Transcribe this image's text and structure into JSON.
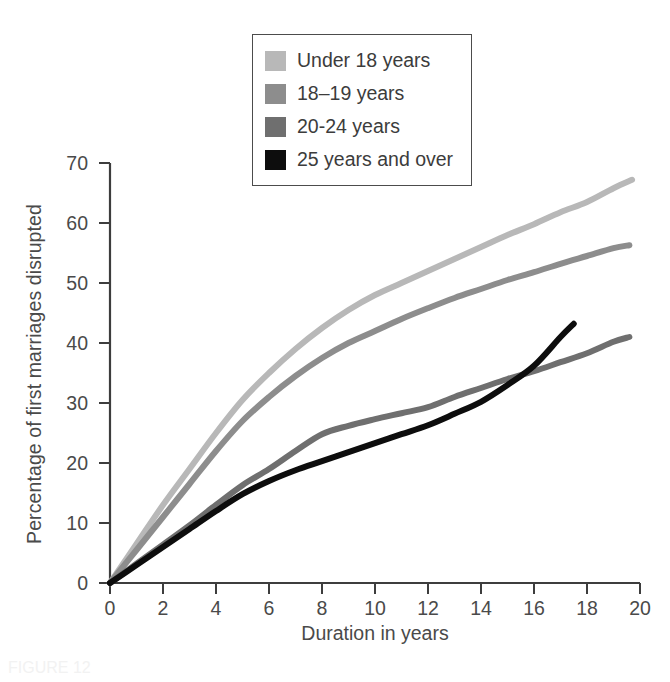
{
  "chart_data": {
    "type": "line",
    "title": "",
    "xlabel": "Duration in years",
    "ylabel": "Percentage of first marriages disrupted",
    "xlim": [
      0,
      20
    ],
    "ylim": [
      0,
      70
    ],
    "xticks": [
      0,
      2,
      4,
      6,
      8,
      10,
      12,
      14,
      16,
      18,
      20
    ],
    "yticks": [
      0,
      10,
      20,
      30,
      40,
      50,
      60,
      70
    ],
    "grid": false,
    "legend_position": "top-center",
    "series": [
      {
        "name": "Under 18 years",
        "color": "#b8b8b8",
        "x": [
          0,
          1,
          2,
          3,
          4,
          5,
          6,
          7,
          8,
          9,
          10,
          11,
          12,
          13,
          14,
          15,
          16,
          17,
          18,
          19,
          19.7
        ],
        "values": [
          0,
          6.5,
          13,
          19,
          25,
          30.5,
          35,
          39,
          42.5,
          45.5,
          48,
          50,
          52,
          54,
          56,
          58,
          59.8,
          61.8,
          63.5,
          65.8,
          67.2
        ]
      },
      {
        "name": "18–19 years",
        "color": "#8d8d8d",
        "x": [
          0,
          1,
          2,
          3,
          4,
          5,
          6,
          7,
          8,
          9,
          10,
          11,
          12,
          13,
          14,
          15,
          16,
          17,
          18,
          19,
          19.6
        ],
        "values": [
          0,
          5.5,
          11,
          16.5,
          22,
          27,
          31,
          34.5,
          37.5,
          40,
          42,
          44,
          45.8,
          47.5,
          49,
          50.5,
          51.8,
          53.2,
          54.5,
          55.8,
          56.3
        ]
      },
      {
        "name": "20-24 years",
        "color": "#6f6f6f",
        "x": [
          0,
          1,
          2,
          3,
          4,
          5,
          6,
          7,
          8,
          9,
          10,
          11,
          12,
          13,
          14,
          15,
          16,
          17,
          18,
          19,
          19.6
        ],
        "values": [
          0,
          3.2,
          6.4,
          9.6,
          13,
          16.3,
          19,
          22,
          24.8,
          26.2,
          27.3,
          28.3,
          29.3,
          31,
          32.5,
          34,
          35.3,
          36.8,
          38.3,
          40.2,
          41
        ]
      },
      {
        "name": "25 years and over",
        "color": "#0d0d0d",
        "x": [
          0,
          1,
          2,
          3,
          4,
          5,
          6,
          7,
          8,
          9,
          10,
          11,
          12,
          13,
          14,
          15,
          16,
          17,
          17.5
        ],
        "values": [
          0,
          3,
          6,
          9,
          12,
          14.8,
          17,
          18.8,
          20.3,
          21.8,
          23.3,
          24.8,
          26.3,
          28.2,
          30.2,
          33,
          36.2,
          41,
          43.2
        ]
      }
    ]
  },
  "legend": {
    "items": [
      {
        "label": "Under 18 years",
        "color": "#b8b8b8"
      },
      {
        "label": "18–19 years",
        "color": "#8d8d8d"
      },
      {
        "label": "20-24 years",
        "color": "#6f6f6f"
      },
      {
        "label": "25 years and over",
        "color": "#0d0d0d"
      }
    ]
  },
  "axes": {
    "x_title": "Duration in years",
    "y_title": "Percentage of first marriages disrupted",
    "x_tick_labels": [
      "0",
      "2",
      "4",
      "6",
      "8",
      "10",
      "12",
      "14",
      "16",
      "18",
      "20"
    ],
    "y_tick_labels": [
      "0",
      "10",
      "20",
      "30",
      "40",
      "50",
      "60",
      "70"
    ]
  },
  "caption_remnant": "FIGURE 12"
}
